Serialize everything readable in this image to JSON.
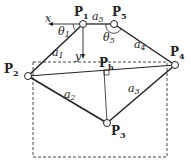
{
  "diagram": {
    "points": [
      {
        "id": "P1",
        "label": "P",
        "sub": "1"
      },
      {
        "id": "P2",
        "label": "P",
        "sub": "2"
      },
      {
        "id": "P3",
        "label": "P",
        "sub": "3"
      },
      {
        "id": "P4",
        "label": "P",
        "sub": "4"
      },
      {
        "id": "P5",
        "label": "P",
        "sub": "5"
      },
      {
        "id": "Ph",
        "label": "P",
        "sub": "h"
      }
    ],
    "links": [
      {
        "label": "a",
        "sub": "1"
      },
      {
        "label": "a",
        "sub": "2"
      },
      {
        "label": "a",
        "sub": "3"
      },
      {
        "label": "a",
        "sub": "4"
      },
      {
        "label": "a",
        "sub": "5"
      }
    ],
    "angles": [
      {
        "label": "θ",
        "sub": "1"
      },
      {
        "label": "θ",
        "sub": "5"
      }
    ],
    "axes": {
      "x": "x",
      "y": "y"
    }
  }
}
